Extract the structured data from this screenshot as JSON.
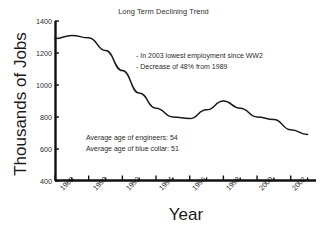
{
  "chart_data": {
    "type": "line",
    "title": "Long Term Declining Trend",
    "xlabel": "Year",
    "ylabel": "Thousands of Jobs",
    "xlim": [
      1988,
      2003.5
    ],
    "ylim": [
      400,
      1400
    ],
    "grid": false,
    "legend": null,
    "y_ticks": [
      1400,
      1200,
      1000,
      800,
      600,
      400
    ],
    "x_ticks": [
      1988,
      1990,
      1992,
      1994,
      1996,
      1998,
      2000,
      2002
    ],
    "x_minor_ticks": [
      1989,
      1991,
      1993,
      1995,
      1997,
      1999,
      2001,
      2003
    ],
    "series": [
      {
        "name": "Jobs",
        "color": "#1a1a1a",
        "x": [
          1988,
          1989,
          1990,
          1991,
          1992,
          1993,
          1994,
          1995,
          1996,
          1997,
          1998,
          1999,
          2000,
          2001,
          2002,
          2003
        ],
        "values": [
          1290,
          1310,
          1295,
          1215,
          1090,
          950,
          855,
          800,
          790,
          845,
          900,
          855,
          800,
          785,
          720,
          690
        ]
      }
    ],
    "annotations": [
      {
        "id": "note-ww2",
        "text": "- In 2003 lowest employment since WW2"
      },
      {
        "id": "note-decrease",
        "text": "- Decrease of 48% from 1989"
      },
      {
        "id": "note-engineers",
        "text": "Average age of engineers: 54"
      },
      {
        "id": "note-blue-collar",
        "text": "Average age of blue collar: 51"
      }
    ]
  },
  "axis": {
    "y_tick_0": "1400",
    "y_tick_1": "1200",
    "y_tick_2": "1000",
    "y_tick_3": "800",
    "y_tick_4": "600",
    "y_tick_5": "400",
    "x_tick_0": "1988",
    "x_tick_1": "1990",
    "x_tick_2": "1992",
    "x_tick_3": "1994",
    "x_tick_4": "1996",
    "x_tick_5": "1998",
    "x_tick_6": "2000",
    "x_tick_7": "2002"
  },
  "annotations": {
    "top_line_1": "- In 2003 lowest employment since WW2",
    "top_line_2": "- Decrease of 48% from 1989",
    "bottom_line_1": "Average age of engineers: 54",
    "bottom_line_2": "Average age of blue collar: 51"
  }
}
